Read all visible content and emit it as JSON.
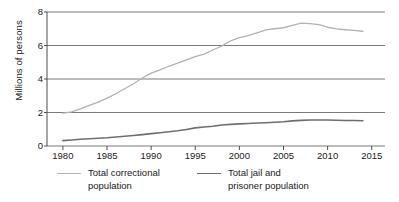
{
  "chart_data": {
    "type": "line",
    "title": "",
    "xlabel": "",
    "ylabel": "Millions of persons",
    "xlim": [
      1978.2,
      2016.5
    ],
    "ylim": [
      0,
      8
    ],
    "xticks": [
      1980,
      1985,
      1990,
      1995,
      2000,
      2005,
      2010,
      2015
    ],
    "xtick_labels": [
      "1980",
      "1985",
      "1990",
      "1995",
      "2000",
      "2005",
      "2010",
      "2015"
    ],
    "yticks": [
      0,
      2,
      4,
      6,
      8
    ],
    "ytick_labels": [
      "0",
      "2",
      "4",
      "6",
      "8"
    ],
    "grid": "horizontal",
    "legend_position": "bottom",
    "series": [
      {
        "name": "Total correctional population",
        "color": "#b2b2b2",
        "x": [
          1980,
          1981,
          1982,
          1983,
          1984,
          1985,
          1986,
          1987,
          1988,
          1989,
          1990,
          1991,
          1992,
          1993,
          1994,
          1995,
          1996,
          1997,
          1998,
          1999,
          2000,
          2001,
          2002,
          2003,
          2004,
          2005,
          2006,
          2007,
          2008,
          2009,
          2010,
          2011,
          2012,
          2013,
          2014
        ],
        "values": [
          1.96,
          2.04,
          2.22,
          2.42,
          2.62,
          2.86,
          3.12,
          3.42,
          3.72,
          4.06,
          4.35,
          4.54,
          4.76,
          4.95,
          5.14,
          5.34,
          5.49,
          5.73,
          5.96,
          6.28,
          6.47,
          6.59,
          6.76,
          6.93,
          7.0,
          7.06,
          7.2,
          7.34,
          7.31,
          7.24,
          7.09,
          6.99,
          6.94,
          6.9,
          6.85
        ]
      },
      {
        "name": "Total jail and prisoner population",
        "color": "#6e6e6e",
        "x": [
          1980,
          1981,
          1982,
          1983,
          1984,
          1985,
          1986,
          1987,
          1988,
          1989,
          1990,
          1991,
          1992,
          1993,
          1994,
          1995,
          1996,
          1997,
          1998,
          1999,
          2000,
          2001,
          2002,
          2003,
          2004,
          2005,
          2006,
          2007,
          2008,
          2009,
          2010,
          2011,
          2012,
          2013,
          2014
        ],
        "values": [
          0.32,
          0.36,
          0.4,
          0.43,
          0.46,
          0.49,
          0.54,
          0.58,
          0.63,
          0.68,
          0.74,
          0.79,
          0.85,
          0.91,
          0.99,
          1.08,
          1.13,
          1.18,
          1.25,
          1.29,
          1.32,
          1.34,
          1.37,
          1.39,
          1.42,
          1.45,
          1.5,
          1.53,
          1.55,
          1.55,
          1.55,
          1.54,
          1.52,
          1.52,
          1.51
        ]
      }
    ]
  },
  "legend": {
    "entries": [
      {
        "line1": "Total correctional",
        "line2": "population"
      },
      {
        "line1": "Total jail and",
        "line2": "prisoner population"
      }
    ]
  },
  "colors": {
    "axis": "#4d4d4d",
    "grid": "#7a7a7a",
    "text": "#1a1a1a",
    "series_light": "#b2b2b2",
    "series_dark": "#6e6e6e",
    "background": "#ffffff"
  }
}
